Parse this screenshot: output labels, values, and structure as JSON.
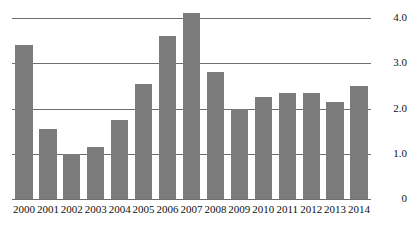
{
  "chart_data": {
    "type": "bar",
    "title": "",
    "subtitle": "",
    "xlabel": "",
    "ylabel": "",
    "categories": [
      "2000",
      "2001",
      "2002",
      "2003",
      "2004",
      "2005",
      "2006",
      "2007",
      "2008",
      "2009",
      "2010",
      "2011",
      "2012",
      "2013",
      "2014"
    ],
    "values": [
      3.4,
      1.55,
      1.0,
      1.15,
      1.75,
      2.55,
      3.6,
      4.1,
      2.8,
      2.0,
      2.25,
      2.35,
      2.35,
      2.15,
      2.5
    ],
    "ylim": [
      0,
      4.0
    ],
    "ytick_values": [
      4.0,
      3.0,
      2.0,
      1.0,
      0
    ],
    "ytick_labels": [
      "4.0",
      "3.0",
      "2.0",
      "1.0",
      "0"
    ],
    "ytick_label_position": "right",
    "grid": true,
    "grid_axis": "y",
    "legend": false,
    "legend_position": "none",
    "bar_color": "#7b7b7b",
    "grid_color": "#6f6f6f",
    "axis_text_color": "#111111",
    "background_color": "#ffffff",
    "series": [
      {
        "name": "series-1",
        "values": [
          3.4,
          1.55,
          1.0,
          1.15,
          1.75,
          2.55,
          3.6,
          4.1,
          2.8,
          2.0,
          2.25,
          2.35,
          2.35,
          2.15,
          2.5
        ]
      }
    ]
  }
}
